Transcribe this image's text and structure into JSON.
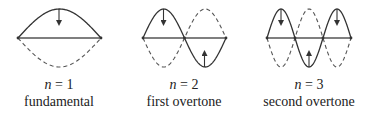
{
  "figure": {
    "modes": [
      {
        "n": "1",
        "equation_var": "n",
        "equation_op": " = ",
        "name": "fundamental",
        "center_x": 59,
        "left_x": 18,
        "right_x": 101,
        "loops": 1,
        "arrows": [
          {
            "x": 59,
            "direction": "down"
          }
        ]
      },
      {
        "n": "2",
        "equation_var": "n",
        "equation_op": " = ",
        "name": "first overtone",
        "center_x": 184,
        "left_x": 143,
        "right_x": 226,
        "loops": 2,
        "arrows": [
          {
            "x": 163.5,
            "direction": "down"
          },
          {
            "x": 204.5,
            "direction": "up"
          }
        ]
      },
      {
        "n": "3",
        "equation_var": "n",
        "equation_op": " = ",
        "name": "second overtone",
        "center_x": 309,
        "left_x": 267,
        "right_x": 351,
        "loops": 3,
        "arrows": [
          {
            "x": 281,
            "direction": "down"
          },
          {
            "x": 309,
            "direction": "up"
          },
          {
            "x": 337,
            "direction": "down"
          }
        ]
      }
    ],
    "baseline_y": 38,
    "amplitude": 29,
    "colors": {
      "solid": "#333333",
      "dashed": "#555555",
      "baseline": "#555555",
      "text": "#222222"
    }
  }
}
